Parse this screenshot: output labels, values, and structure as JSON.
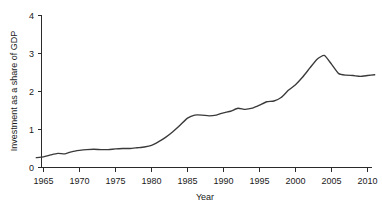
{
  "chart_data": {
    "type": "line",
    "title": "",
    "xlabel": "Year",
    "ylabel": "Investment as a share of GDP",
    "xlim": [
      1964,
      2011
    ],
    "ylim": [
      0,
      4
    ],
    "xticks": [
      1965,
      1970,
      1975,
      1980,
      1985,
      1990,
      1995,
      2000,
      2005,
      2010
    ],
    "xtick_labels": [
      "1965",
      "1970",
      "1975",
      "1980",
      "1985",
      "1990",
      "1995",
      "2000",
      "2005",
      "2010"
    ],
    "yticks": [
      0,
      1,
      2,
      3,
      4
    ],
    "ytick_labels": [
      "0",
      "1",
      "2",
      "3",
      "4"
    ],
    "grid": false,
    "legend": "none",
    "line_color": "#3a3a3a",
    "axis_color": "#2b2b2b",
    "series": [
      {
        "name": "Investment as a share of GDP",
        "x": [
          1964,
          1965,
          1966,
          1967,
          1968,
          1969,
          1970,
          1971,
          1972,
          1973,
          1974,
          1975,
          1976,
          1977,
          1978,
          1979,
          1980,
          1981,
          1982,
          1983,
          1984,
          1985,
          1986,
          1987,
          1988,
          1989,
          1990,
          1991,
          1992,
          1993,
          1994,
          1995,
          1996,
          1997,
          1998,
          1999,
          2000,
          2001,
          2002,
          2003,
          2004,
          2005,
          2006,
          2007,
          2008,
          2009,
          2010,
          2011
        ],
        "values": [
          0.26,
          0.28,
          0.33,
          0.37,
          0.36,
          0.42,
          0.45,
          0.47,
          0.48,
          0.47,
          0.47,
          0.49,
          0.5,
          0.5,
          0.52,
          0.54,
          0.58,
          0.68,
          0.8,
          0.95,
          1.12,
          1.3,
          1.38,
          1.38,
          1.36,
          1.38,
          1.44,
          1.48,
          1.56,
          1.53,
          1.56,
          1.64,
          1.73,
          1.75,
          1.84,
          2.03,
          2.18,
          2.38,
          2.62,
          2.85,
          2.95,
          2.72,
          2.47,
          2.43,
          2.42,
          2.4,
          2.42,
          2.44
        ]
      }
    ]
  }
}
